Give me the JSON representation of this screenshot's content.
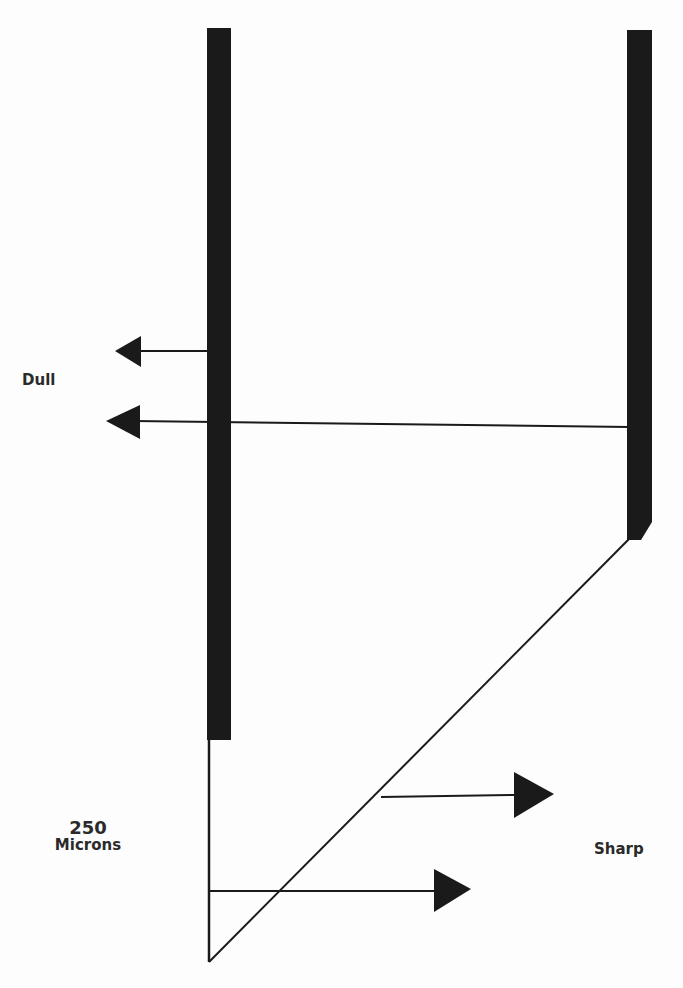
{
  "labels": {
    "dull": "Dull",
    "sharp": "Sharp",
    "thickness_value": "250",
    "thickness_unit": "Microns"
  },
  "colors": {
    "ink": "#1a1a1a",
    "background": "#fdfdfd"
  }
}
